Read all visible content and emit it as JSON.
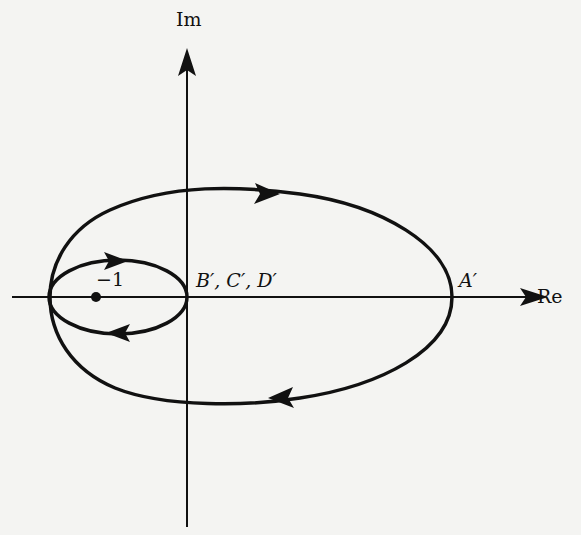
{
  "figure": {
    "type": "nyquist-plot",
    "axes": {
      "x_label": "Re",
      "y_label": "Im"
    },
    "points": {
      "critical_point_label": "−1",
      "origin_label": "B′, C′, D′",
      "a_prime_label": "A′"
    },
    "curves": [
      {
        "name": "outer-contour",
        "direction": "clockwise",
        "description": "Large teardrop contour from A′ on positive real axis, encircling the origin and −1"
      },
      {
        "name": "inner-loop",
        "direction": "clockwise",
        "description": "Small ellipse passing through origin, encircling −1"
      }
    ],
    "colors": {
      "background": "#f4f4f2",
      "ink": "#111111"
    }
  }
}
